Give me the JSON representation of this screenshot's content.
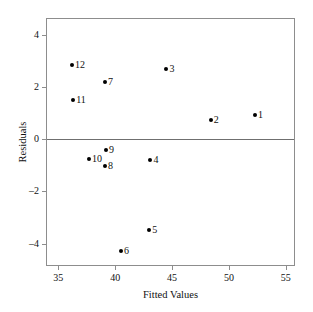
{
  "chart_data": {
    "type": "scatter",
    "title": "",
    "xlabel": "Fitted Values",
    "ylabel": "Residuals",
    "xlim": [
      34.0,
      55.9
    ],
    "ylim": [
      -4.9,
      4.6
    ],
    "xticks": [
      35,
      40,
      45,
      50,
      55
    ],
    "xtick_labels": [
      "35",
      "40",
      "45",
      "50",
      "55"
    ],
    "yticks": [
      4,
      2,
      0,
      -2,
      -4
    ],
    "ytick_labels": [
      "4",
      "2",
      "0",
      "–2",
      "–4"
    ],
    "grid": false,
    "legend": null,
    "reference_lines": [
      {
        "name": "zero-residual-line",
        "axis": "y",
        "value": 0
      }
    ],
    "points": [
      {
        "label": "1",
        "x": 52.3,
        "y": 0.92,
        "label_side": "right"
      },
      {
        "label": "2",
        "x": 48.4,
        "y": 0.73,
        "label_side": "right"
      },
      {
        "label": "3",
        "x": 44.5,
        "y": 2.7,
        "label_side": "right"
      },
      {
        "label": "4",
        "x": 43.1,
        "y": -0.79,
        "label_side": "right"
      },
      {
        "label": "5",
        "x": 43.0,
        "y": -3.5,
        "label_side": "right"
      },
      {
        "label": "6",
        "x": 40.5,
        "y": -4.28,
        "label_side": "right"
      },
      {
        "label": "7",
        "x": 39.1,
        "y": 2.17,
        "label_side": "right"
      },
      {
        "label": "8",
        "x": 39.1,
        "y": -1.02,
        "label_side": "right"
      },
      {
        "label": "9",
        "x": 39.2,
        "y": -0.42,
        "label_side": "right"
      },
      {
        "label": "10",
        "x": 37.7,
        "y": -0.77,
        "label_side": "right"
      },
      {
        "label": "11",
        "x": 36.3,
        "y": 1.5,
        "label_side": "right"
      },
      {
        "label": "12",
        "x": 36.2,
        "y": 2.85,
        "label_side": "right"
      }
    ]
  }
}
